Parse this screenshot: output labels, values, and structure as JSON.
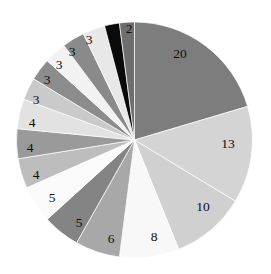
{
  "chart_data": {
    "type": "pie",
    "title": "",
    "subtitle": "",
    "xlabel": "",
    "ylabel": "",
    "legend": "none",
    "grid": false,
    "start_angle_deg": 0,
    "direction": "clockwise",
    "center": {
      "x": 134.5,
      "y": 140
    },
    "radius": 118,
    "total": 100,
    "labels_shown": true,
    "label_style": "value",
    "categories": [
      "slice-1",
      "slice-2",
      "slice-3",
      "slice-4",
      "slice-5",
      "slice-6",
      "slice-7",
      "slice-8",
      "slice-9",
      "slice-10",
      "slice-11",
      "slice-12",
      "slice-13",
      "slice-14",
      "slice-15",
      "slice-16",
      "slice-17"
    ],
    "values": [
      20,
      13,
      10,
      8,
      6,
      5,
      5,
      4,
      4,
      4,
      3,
      3,
      3,
      3,
      2,
      2,
      5
    ],
    "slices": [
      {
        "label": "20",
        "value": 20,
        "color": "#7d7d7d",
        "label_x": 180,
        "label_y": 55
      },
      {
        "label": "13",
        "value": 13,
        "color": "#d4d4d4",
        "label_x": 228,
        "label_y": 145
      },
      {
        "label": "10",
        "value": 10,
        "color": "#d0d0d0",
        "label_x": 203,
        "label_y": 208
      },
      {
        "label": "8",
        "value": 8,
        "color": "#f8f8f8",
        "label_x": 154,
        "label_y": 238
      },
      {
        "label": "6",
        "value": 6,
        "color": "#a8a8a8",
        "label_x": 111,
        "label_y": 240
      },
      {
        "label": "5",
        "value": 5,
        "color": "#848484",
        "label_x": 79,
        "label_y": 224
      },
      {
        "label": "5",
        "value": 5,
        "color": "#fafafa",
        "label_x": 52,
        "label_y": 199
      },
      {
        "label": "4",
        "value": 4,
        "color": "#bdbdbd",
        "label_x": 36,
        "label_y": 176
      },
      {
        "label": "4",
        "value": 4,
        "color": "#9a9a9a",
        "label_x": 30,
        "label_y": 149
      },
      {
        "label": "4",
        "value": 4,
        "color": "#e2e2e2",
        "label_x": 32,
        "label_y": 124
      },
      {
        "label": "3",
        "value": 3,
        "color": "#cacaca",
        "label_x": 36,
        "label_y": 101
      },
      {
        "label": "3",
        "value": 3,
        "color": "#8c8c8c",
        "label_x": 47,
        "label_y": 81
      },
      {
        "label": "3",
        "value": 3,
        "color": "#f2f2f2",
        "label_x": 59,
        "label_y": 66
      },
      {
        "label": "3",
        "value": 3,
        "color": "#8a8a8a",
        "label_x": 72,
        "label_y": 53
      },
      {
        "label": "3",
        "value": 3,
        "color": "#e8e8e8",
        "label_x": 89,
        "label_y": 41
      },
      {
        "label": "2",
        "value": 2,
        "color": "#0a0a0a",
        "label_x": 112,
        "label_y": 33
      },
      {
        "label": "2",
        "value": 2,
        "color": "#6e6e6e",
        "label_x": 129,
        "label_y": 30
      }
    ],
    "background_color": "#ffffff",
    "edge_color": "#ffffff"
  }
}
